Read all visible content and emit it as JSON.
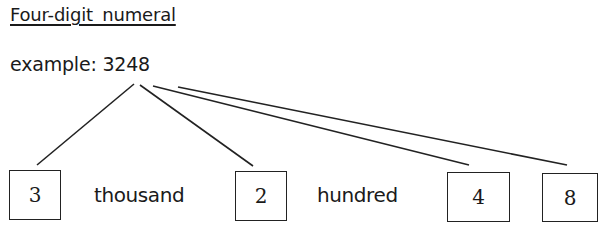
{
  "title": "Four-digit numeral",
  "example_label": "example: 3248",
  "digits": [
    {
      "value": "3",
      "place": "thousand"
    },
    {
      "value": "2",
      "place": "hundred"
    },
    {
      "value": "4",
      "place": ""
    },
    {
      "value": "8",
      "place": ""
    }
  ],
  "place_words": {
    "thousand": "thousand",
    "hundred": "hundred"
  },
  "colors": {
    "ink": "#1a1a1a",
    "background": "#ffffff"
  }
}
